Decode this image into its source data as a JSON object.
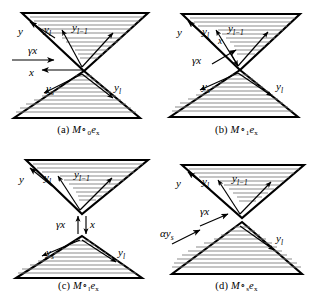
{
  "figure": {
    "type": "schematic-diagram-grid",
    "panel_count": 4,
    "background": "#ffffff",
    "stroke": "#000000",
    "hatch_color": "#555555"
  },
  "panels": [
    {
      "id": "a",
      "caption_prefix": "(a)",
      "caption_main": "M",
      "caption_ring": "∘",
      "caption_ring_sub": "0",
      "caption_e": "e",
      "caption_e_sub": "x",
      "labels": {
        "y": "y",
        "y_l_top": "y",
        "y_l_top_sub": "l",
        "y_lm1": "y",
        "y_lm1_sub": "l−1",
        "gamma_x": "γx",
        "x": "x",
        "y_s": "y",
        "y_s_sub": "s",
        "y_l_bottom": "y",
        "y_l_bottom_sub": "l"
      }
    },
    {
      "id": "b",
      "caption_prefix": "(b)",
      "caption_main": "M",
      "caption_ring": "∘",
      "caption_ring_sub": "1",
      "caption_e": "e",
      "caption_e_sub": "x",
      "labels": {
        "y": "y",
        "y_l_top": "y",
        "y_l_top_sub": "l",
        "y_lm1": "y",
        "y_lm1_sub": "l−1",
        "gamma_x": "γx",
        "x": "x",
        "y_s": "y",
        "y_s_sub": "s",
        "y_l_bottom": "y",
        "y_l_bottom_sub": "l"
      }
    },
    {
      "id": "c",
      "caption_prefix": "(c)",
      "caption_main": "M",
      "caption_ring": "∘",
      "caption_ring_sub": "l",
      "caption_e": "e",
      "caption_e_sub": "x",
      "labels": {
        "y": "y",
        "y_l_top": "y",
        "y_l_top_sub": "l",
        "y_lm1": "y",
        "y_lm1_sub": "l−1",
        "gamma_x": "γx",
        "x": "x",
        "y_s": "y",
        "y_s_sub": "s",
        "y_l_bottom": "y",
        "y_l_bottom_sub": "l"
      }
    },
    {
      "id": "d",
      "caption_prefix": "(d)",
      "caption_main": "M",
      "caption_ring": "∘",
      "caption_ring_sub": "s",
      "caption_e": "e",
      "caption_e_sub": "x",
      "labels": {
        "y": "y",
        "y_l_top": "y",
        "y_l_top_sub": "l",
        "y_lm1": "y",
        "y_lm1_sub": "l−1",
        "gamma_x": "γx",
        "alpha_y_s": "αy",
        "alpha_y_s_sub": "s",
        "y_l_bottom": "y",
        "y_l_bottom_sub": "l"
      }
    }
  ]
}
